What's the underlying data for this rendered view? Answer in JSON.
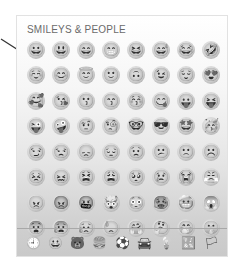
{
  "panel": {
    "section_title": "SMILEYS & PEOPLE"
  },
  "emoji_rows": [
    [
      "😀",
      "😃",
      "😄",
      "😁",
      "😆",
      "😅",
      "😂",
      "🤣"
    ],
    [
      "☺️",
      "😊",
      "😇",
      "🙂",
      "🙃",
      "😉",
      "😌",
      "😍"
    ],
    [
      "🥰",
      "😘",
      "😗",
      "😙",
      "😚",
      "😋",
      "😛",
      "😝"
    ],
    [
      "😜",
      "🤪",
      "🤨",
      "🧐",
      "🤓",
      "😎",
      "🤩",
      "🥳"
    ],
    [
      "😏",
      "😒",
      "😞",
      "😔",
      "😟",
      "😕",
      "🙁",
      "☹️"
    ],
    [
      "😣",
      "😖",
      "😫",
      "😩",
      "🥺",
      "😢",
      "😭",
      "😤"
    ],
    [
      "😠",
      "😡",
      "🤬",
      "🤯",
      "😳",
      "🥵",
      "🥶",
      "😱"
    ],
    [
      "😨",
      "😰",
      "😥",
      "😓",
      "🤗",
      "🤔",
      "🤭",
      "🤫"
    ]
  ],
  "categories": [
    {
      "name": "recent",
      "icon": "🕘"
    },
    {
      "name": "smileys-people",
      "icon": "😀"
    },
    {
      "name": "animals-nature",
      "icon": "🐻"
    },
    {
      "name": "food-drink",
      "icon": "🍔"
    },
    {
      "name": "activity",
      "icon": "⚽"
    },
    {
      "name": "travel-places",
      "icon": "🚘"
    },
    {
      "name": "objects",
      "icon": "💡"
    },
    {
      "name": "symbols",
      "icon": "🔣"
    },
    {
      "name": "flags",
      "icon": "🏳"
    }
  ]
}
